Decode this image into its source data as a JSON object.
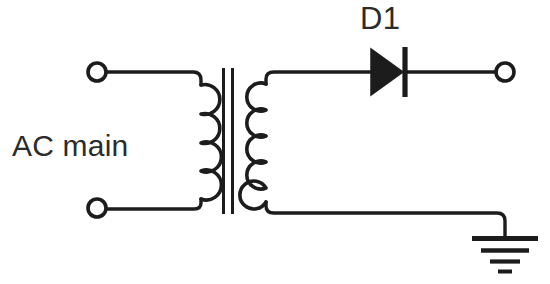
{
  "diagram": {
    "type": "circuit-schematic",
    "background_color": "#ffffff",
    "line_color": "#1c1c1c",
    "text_color": "#2b2b2b"
  },
  "labels": {
    "source": "AC main",
    "diode": "D1"
  },
  "components": {
    "source_terminal_top": {
      "name": "ac-input-terminal-top",
      "shape": "open-circle",
      "cx": 97,
      "cy": 72,
      "r": 9
    },
    "source_terminal_bottom": {
      "name": "ac-input-terminal-bottom",
      "shape": "open-circle",
      "cx": 97,
      "cy": 208,
      "r": 9
    },
    "output_terminal": {
      "name": "dc-output-terminal",
      "shape": "open-circle",
      "cx": 505,
      "cy": 72,
      "r": 9
    },
    "transformer": {
      "name": "transformer",
      "primary_turns": 4,
      "secondary_turns": 5,
      "core_lines": 2,
      "core_x": [
        223,
        232
      ],
      "core_top": 68,
      "core_bottom": 214
    },
    "diode": {
      "name": "diode-d1",
      "orientation": "anode-left-cathode-right",
      "triangle_x1": 371,
      "triangle_x2": 403,
      "triangle_top": 49,
      "triangle_bottom": 95,
      "bar_x": 405
    },
    "ground": {
      "name": "ground-symbol",
      "bar_count": 4,
      "bar_widths": [
        66,
        48,
        30,
        14
      ],
      "x": 505,
      "top_y": 237
    }
  },
  "nets": {
    "primary_top_wire": "terminal-top to primary coil top",
    "primary_bottom_wire": "terminal-bottom to primary coil bottom",
    "secondary_top_wire": "secondary coil top to diode anode",
    "diode_output_wire": "diode cathode to output terminal",
    "secondary_bottom_wire": "secondary coil bottom to ground"
  }
}
